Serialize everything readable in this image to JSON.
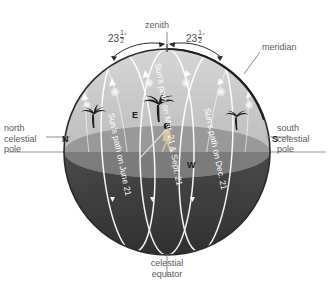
{
  "diagram": {
    "colors": {
      "sphere_upper": "#c9c9c9",
      "sphere_lower": "#3a3a3a",
      "horizon_plane": "#8a8a8a",
      "outline": "#2b2b2b",
      "path_line": "#ffffff",
      "text": "#5a5a5a",
      "sun_dot": "#f2f2f2"
    },
    "labels": {
      "zenith": "zenith",
      "meridian": "meridian",
      "north_celestial_pole": "north\ncelestial\npole",
      "north_celestial_pole_line1": "north",
      "north_celestial_pole_line2": "celestial",
      "north_celestial_pole_line3": "pole",
      "south_celestial_pole_line1": "south",
      "south_celestial_pole_line2": "celestial",
      "south_celestial_pole_line3": "pole",
      "celestial_equator_line1": "celestial",
      "celestial_equator_line2": "equator"
    },
    "angles": {
      "left_whole": "23",
      "left_numerator": "1",
      "left_denominator": "2",
      "left_degree": "°",
      "right_whole": "23",
      "right_numerator": "1",
      "right_denominator": "2",
      "right_degree": "°",
      "value_text": "23 1/2 degrees",
      "description": "Tilt of the June and December solstice sun paths from the zenith"
    },
    "cardinal_points": {
      "north": "N",
      "south": "S",
      "east": "E",
      "west": "W"
    },
    "sun_paths": [
      {
        "id": "june",
        "label": "Sun's path on June 21",
        "date": "June 21",
        "offset_degrees": "23 1/2 north of celestial equator"
      },
      {
        "id": "equinox",
        "label": "Sun's path on Mar. 21 & Sept. 21",
        "date": "Mar. 21 & Sept. 21",
        "offset_degrees": "0 (on celestial equator)"
      },
      {
        "id": "december",
        "label": "Sun's path on Dec. 21",
        "date": "Dec. 21",
        "offset_degrees": "23 1/2 south of celestial equator"
      }
    ]
  }
}
